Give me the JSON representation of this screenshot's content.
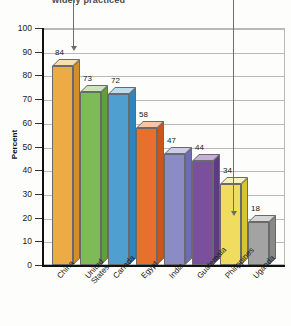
{
  "chart_data": {
    "type": "bar",
    "title": "widely practiced",
    "xlabel": "",
    "ylabel": "Percent",
    "ylim": [
      0,
      100
    ],
    "ytick_step": 10,
    "yticks": [
      "100",
      "90",
      "80",
      "70",
      "60",
      "50",
      "40",
      "30",
      "20",
      "10",
      "0"
    ],
    "grid": true,
    "legend": "none",
    "categories": [
      "China",
      "United\nStates",
      "Canada",
      "Egypt",
      "India",
      "Guatemala",
      "Philippines",
      "Uganda"
    ],
    "values": [
      84,
      73,
      72,
      58,
      47,
      44,
      34,
      18
    ],
    "value_labels": [
      "84",
      "73",
      "72",
      "58",
      "47",
      "44",
      "34",
      "18"
    ],
    "bar_colors": [
      "#eeab42",
      "#7dbb58",
      "#4d9fd0",
      "#e8702f",
      "#8b8cc4",
      "#7a4f9e",
      "#f0d košt44",
      "#9e9e9e"
    ]
  },
  "colors": {
    "bars": [
      {
        "name": "china",
        "front": "#edab45",
        "top": "#f7dfae",
        "side": "#d08f28"
      },
      {
        "name": "united-states",
        "front": "#7cbb57",
        "top": "#cce6b9",
        "side": "#5fa03c"
      },
      {
        "name": "canada",
        "front": "#4fa0d1",
        "top": "#bcdcef",
        "side": "#2f86bd"
      },
      {
        "name": "egypt",
        "front": "#e8702f",
        "top": "#f6c6a6",
        "side": "#cc551a"
      },
      {
        "name": "india",
        "front": "#8b8cc5",
        "top": "#cdcde6",
        "side": "#6d6eaf"
      },
      {
        "name": "guatemala",
        "front": "#7a4f9e",
        "top": "#c6b0d8",
        "side": "#5f3a81"
      },
      {
        "name": "philippines",
        "front": "#f0dc5e",
        "top": "#f9f1bb",
        "side": "#d8c238"
      },
      {
        "name": "uganda",
        "front": "#a3a3a3",
        "top": "#d6d6d6",
        "side": "#888888"
      }
    ],
    "axis": "#111111",
    "grid": "#b9b9b9",
    "annotation": "#6d6d6d",
    "background": "#fdfdfb"
  },
  "annotations": [
    {
      "name": "left-callout-arrow",
      "x": 73,
      "top": 0,
      "bottom": 46
    },
    {
      "name": "right-callout-arrow",
      "x": 233,
      "top": 0,
      "bottom": 211
    }
  ]
}
